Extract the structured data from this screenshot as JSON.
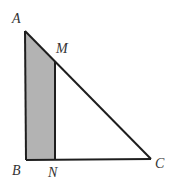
{
  "figure": {
    "type": "right-triangle-with-shaded-trapezoid",
    "points": {
      "A": {
        "x": 25,
        "y": 31
      },
      "B": {
        "x": 26,
        "y": 160
      },
      "C": {
        "x": 151,
        "y": 159
      },
      "M": {
        "x": 55,
        "y": 62
      },
      "N": {
        "x": 55,
        "y": 160
      }
    },
    "labels": {
      "A": "A",
      "B": "B",
      "C": "C",
      "M": "M",
      "N": "N"
    },
    "segments": [
      "AB",
      "BC",
      "CA",
      "MN"
    ],
    "shaded_region": [
      "A",
      "M",
      "N",
      "B"
    ],
    "colors": {
      "stroke": "#1e1e1e",
      "shade": "#b3b3b3",
      "background": "#ffffff",
      "label": "#333333"
    }
  }
}
